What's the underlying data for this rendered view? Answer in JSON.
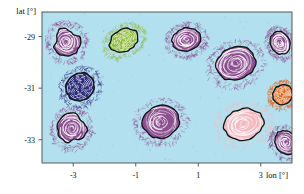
{
  "chart_data": {
    "type": "scatter",
    "title": "",
    "subtitle": "",
    "xlabel": "lon [°]",
    "ylabel": "lat [°]",
    "xlim": [
      -4.0,
      4.0
    ],
    "ylim": [
      -33.9,
      -28.05
    ],
    "xticks": [
      -3,
      -1,
      1,
      3
    ],
    "xticklabels": [
      "-3",
      "-1",
      "1",
      "3"
    ],
    "yticks": [
      -29,
      -31,
      -33
    ],
    "yticklabels": [
      "-29",
      "-31",
      "-33"
    ],
    "grid": false,
    "legend": null,
    "background_color": "#b3e0ef",
    "frame_color": "#4a4a4a",
    "annotations": [],
    "series": [
      {
        "name": "eddies",
        "points": [
          {
            "id": "eddy-1",
            "lon": -3.22,
            "lat": -29.2,
            "rx": 0.44,
            "ry": 0.56,
            "rot": -22,
            "color": "#8c4f90",
            "shape": "teardrop-up",
            "label": ""
          },
          {
            "id": "eddy-2",
            "lon": -1.38,
            "lat": -29.15,
            "rx": 0.48,
            "ry": 0.42,
            "rot": -28,
            "color": "#8fbc3f",
            "shape": "ellipse",
            "label": ""
          },
          {
            "id": "eddy-3",
            "lon": 0.62,
            "lat": -29.12,
            "rx": 0.46,
            "ry": 0.45,
            "rot": -15,
            "color": "#8c4f90",
            "shape": "ellipse",
            "label": ""
          },
          {
            "id": "eddy-4",
            "lon": 3.62,
            "lat": -29.25,
            "rx": 0.3,
            "ry": 0.45,
            "rot": -25,
            "color": "#8c4f90",
            "shape": "ellipse",
            "label": ""
          },
          {
            "id": "eddy-5",
            "lon": 2.2,
            "lat": -30.05,
            "rx": 0.64,
            "ry": 0.62,
            "rot": -20,
            "color": "#8c4f90",
            "shape": "ellipse",
            "label": ""
          },
          {
            "id": "eddy-6",
            "lon": -2.78,
            "lat": -30.95,
            "rx": 0.47,
            "ry": 0.52,
            "rot": -35,
            "color": "#2a2a7a",
            "shape": "ellipse",
            "label": ""
          },
          {
            "id": "eddy-7",
            "lon": 3.7,
            "lat": -31.25,
            "rx": 0.33,
            "ry": 0.37,
            "rot": -35,
            "color": "#e06820",
            "shape": "ellipse",
            "label": ""
          },
          {
            "id": "eddy-8",
            "lon": -3.05,
            "lat": -32.55,
            "rx": 0.45,
            "ry": 0.58,
            "rot": 18,
            "color": "#8c4f90",
            "shape": "teardrop-right",
            "label": ""
          },
          {
            "id": "eddy-9",
            "lon": -0.2,
            "lat": -32.3,
            "rx": 0.58,
            "ry": 0.62,
            "rot": -10,
            "color": "#8c4f90",
            "shape": "ellipse",
            "label": ""
          },
          {
            "id": "eddy-10",
            "lon": 2.45,
            "lat": -32.4,
            "rx": 0.64,
            "ry": 0.6,
            "rot": -12,
            "color": "#f4b8bf",
            "shape": "ellipse",
            "label": ""
          },
          {
            "id": "eddy-11",
            "lon": 3.8,
            "lat": -33.1,
            "rx": 0.34,
            "ry": 0.48,
            "rot": -32,
            "color": "#8c4f90",
            "shape": "ellipse",
            "label": ""
          }
        ]
      }
    ]
  },
  "axes": {
    "ylabel": "lat [°]",
    "xlabel": "lon [°]",
    "yticklabels": [
      "-29",
      "-31",
      "-33"
    ],
    "xticklabels": [
      "-3",
      "-1",
      "1",
      "3"
    ]
  }
}
